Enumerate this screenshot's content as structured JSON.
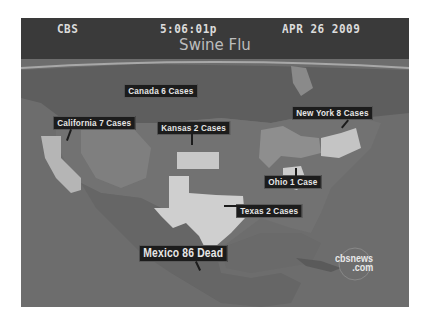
{
  "broadcast": {
    "network": "CBS",
    "time": "5:06:01p",
    "date": "APR 26 2009",
    "title": "Swine Flu"
  },
  "labels": {
    "canada": "Canada  6 Cases",
    "california": "California 7 Cases",
    "kansas": "Kansas 2 Cases",
    "new_york": "New York 8 Cases",
    "ohio": "Ohio 1 Case",
    "texas": "Texas 2 Cases",
    "mexico": "Mexico 86 Dead"
  },
  "watermark": {
    "line1": "cbsnews",
    "line2": ".com"
  },
  "colors": {
    "header_bg": "#3a3a3a",
    "label_bg": "#1c1c1c",
    "ocean": "#6b6b6b",
    "highlight_state": "#c8c8c8"
  }
}
